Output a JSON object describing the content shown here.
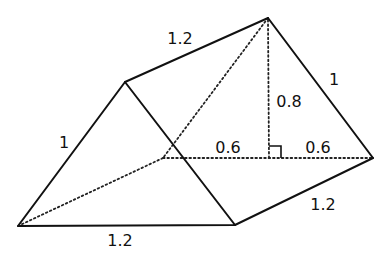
{
  "figure": {
    "type": "triangular-prism",
    "colors": {
      "background": "#ffffff",
      "stroke": "#111111"
    },
    "labels": {
      "top_edge": "1.2",
      "back_slant_edge": "1",
      "height": "0.8",
      "base_left_half": "0.6",
      "base_right_half": "0.6",
      "front_slant_edge": "1",
      "bottom_right_edge": "1.2",
      "bottom_front_edge": "1.2"
    },
    "right_angle_marker": true
  }
}
